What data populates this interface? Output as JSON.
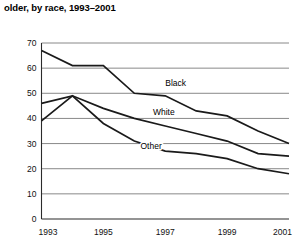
{
  "caption": "older, by race, 1993–2001",
  "chart_data": {
    "type": "line",
    "title": "older, by race, 1993–2001",
    "xlabel": "",
    "ylabel": "",
    "x": [
      1993,
      1994,
      1995,
      1996,
      1997,
      1998,
      1999,
      2000,
      2001
    ],
    "xtick_labels": [
      "1993",
      "1995",
      "1997",
      "1999",
      "2001"
    ],
    "xticks": [
      1993,
      1995,
      1997,
      1999,
      2001
    ],
    "xlim": [
      1993,
      2001
    ],
    "ytick_labels": [
      "0",
      "10",
      "20",
      "30",
      "40",
      "50",
      "60",
      "70"
    ],
    "yticks": [
      0,
      10,
      20,
      30,
      40,
      50,
      60,
      70
    ],
    "ylim": [
      0,
      70
    ],
    "grid": "horizontal",
    "legend": "inline-annotations",
    "series": [
      {
        "name": "Black",
        "label": "Black",
        "color": "#1a1a1a",
        "values": [
          67,
          61,
          61,
          50,
          49,
          43,
          41,
          35,
          30
        ]
      },
      {
        "name": "White",
        "label": "White",
        "color": "#1a1a1a",
        "values": [
          46,
          49,
          44,
          40,
          37,
          34,
          31,
          26,
          25
        ]
      },
      {
        "name": "Other",
        "label": "Other",
        "color": "#1a1a1a",
        "values": [
          39,
          49,
          38,
          31,
          27,
          26,
          24,
          20,
          18
        ]
      }
    ],
    "annotations": [
      {
        "text": "Black",
        "x": 1997.0,
        "y": 53.0
      },
      {
        "text": "White",
        "x": 1996.6,
        "y": 41.5
      },
      {
        "text": "Other",
        "x": 1996.2,
        "y": 28.0
      }
    ]
  }
}
